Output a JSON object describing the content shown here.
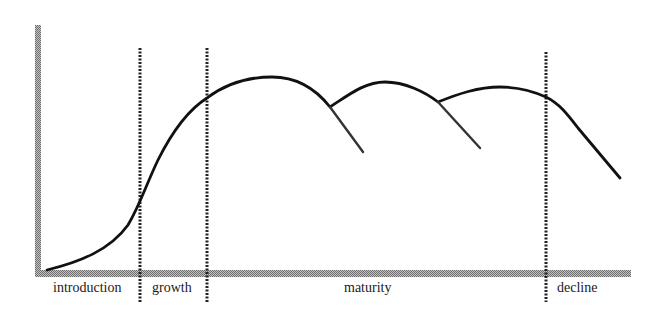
{
  "diagram": {
    "title": "",
    "type": "product-life-cycle",
    "colors": {
      "axis": "#9a9a9a",
      "curve": "#111111",
      "divider": "#222222",
      "text": "#1a1a1a",
      "background": "#ffffff"
    },
    "stages": [
      {
        "id": "introduction",
        "label": "introduction"
      },
      {
        "id": "growth",
        "label": "growth"
      },
      {
        "id": "maturity",
        "label": "maturity"
      },
      {
        "id": "decline",
        "label": "decline"
      }
    ],
    "dividers": [
      {
        "between": "introduction|growth"
      },
      {
        "between": "growth|maturity"
      },
      {
        "between": "maturity|decline"
      }
    ],
    "curves": [
      {
        "name": "main-sales-curve",
        "description": "S-shaped rise through introduction and growth, successive humps during maturity, falling in decline"
      },
      {
        "name": "abandoned-branch-1",
        "description": "first maturity hump continuing downward if not extended"
      },
      {
        "name": "abandoned-branch-2",
        "description": "second maturity hump continuing downward if not extended"
      }
    ]
  }
}
